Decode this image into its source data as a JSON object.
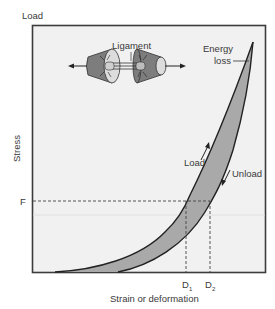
{
  "diagram": {
    "y_axis_top_label": "Load",
    "y_axis_label": "Stress",
    "x_axis_label": "Strain or deformation",
    "force_marker": "F",
    "d1": {
      "letter": "D",
      "sub": "1"
    },
    "d2": {
      "letter": "D",
      "sub": "2"
    },
    "ligament_label": "Ligament",
    "energy_loss_label_line1": "Energy",
    "energy_loss_label_line2": "loss",
    "load_curve_label": "Load",
    "unload_curve_label": "Unload"
  },
  "colors": {
    "frame_bg": "#f1f1f1",
    "frame_stroke": "#3c3c3c",
    "band_fill": "#a9a9a9",
    "bone_dark": "#7d7d7d",
    "bone_light": "#dcdcdc",
    "curve_stroke": "#222222"
  }
}
